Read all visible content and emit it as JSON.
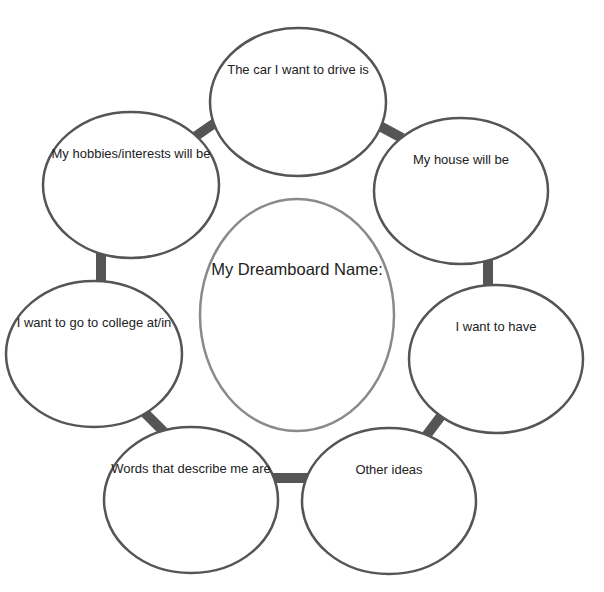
{
  "diagram": {
    "center": {
      "label": "My Dreamboard Name:",
      "cx": 297,
      "cy": 315,
      "rx": 97,
      "ry": 116,
      "stroke": "#8a8a8a"
    },
    "bubbles": [
      {
        "id": "car",
        "label": "The car I want to drive is",
        "cx": 298,
        "cy": 102,
        "rx": 88,
        "ry": 74
      },
      {
        "id": "house",
        "label": "My house will be",
        "cx": 461,
        "cy": 191,
        "rx": 87,
        "ry": 73
      },
      {
        "id": "want",
        "label": "I want to have",
        "cx": 496,
        "cy": 359,
        "rx": 87,
        "ry": 74
      },
      {
        "id": "other",
        "label": "Other ideas",
        "cx": 389,
        "cy": 501,
        "rx": 87,
        "ry": 73
      },
      {
        "id": "words",
        "label": "Words that describe me are",
        "cx": 191,
        "cy": 500,
        "rx": 87,
        "ry": 73
      },
      {
        "id": "college",
        "label": "I want to go to college at/in",
        "cx": 94,
        "cy": 354,
        "rx": 88,
        "ry": 73
      },
      {
        "id": "hobbies",
        "label": "My hobbies/interests will be",
        "cx": 131,
        "cy": 185,
        "rx": 88,
        "ry": 73
      }
    ],
    "connectors": [
      {
        "from": "hobbies",
        "to": "car",
        "x1": 196,
        "y1": 136,
        "x2": 222,
        "y2": 118
      },
      {
        "from": "car",
        "to": "house",
        "x1": 376,
        "y1": 124,
        "x2": 402,
        "y2": 138
      },
      {
        "from": "house",
        "to": "want",
        "x1": 488,
        "y1": 258,
        "x2": 488,
        "y2": 292
      },
      {
        "from": "want",
        "to": "other",
        "x1": 426,
        "y1": 436,
        "x2": 444,
        "y2": 412
      },
      {
        "from": "other",
        "to": "words",
        "x1": 272,
        "y1": 478,
        "x2": 308,
        "y2": 478
      },
      {
        "from": "words",
        "to": "college",
        "x1": 142,
        "y1": 410,
        "x2": 166,
        "y2": 434
      },
      {
        "from": "college",
        "to": "hobbies",
        "x1": 101,
        "y1": 252,
        "x2": 101,
        "y2": 288
      }
    ],
    "colors": {
      "bubble_stroke": "#555555",
      "connector": "#555555",
      "background": "#ffffff"
    }
  }
}
